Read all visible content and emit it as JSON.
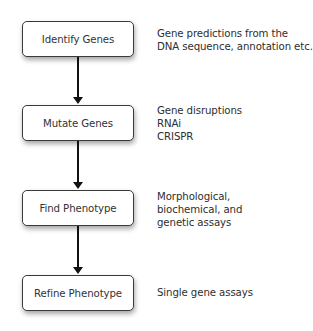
{
  "diagram": {
    "type": "flowchart",
    "direction": "top-to-bottom",
    "steps": [
      {
        "label": "Identify Genes",
        "notes": [
          "Gene predictions from the",
          "DNA sequence, annotation etc."
        ]
      },
      {
        "label": "Mutate Genes",
        "notes": [
          "Gene disruptions",
          "RNAi",
          "CRISPR"
        ]
      },
      {
        "label": "Find Phenotype",
        "notes": [
          "Morphological,",
          "biochemical, and",
          "genetic assays"
        ]
      },
      {
        "label": "Refine Phenotype",
        "notes": [
          "Single gene assays"
        ]
      }
    ],
    "edges": [
      {
        "from": "Identify Genes",
        "to": "Mutate Genes"
      },
      {
        "from": "Mutate Genes",
        "to": "Find Phenotype"
      },
      {
        "from": "Find Phenotype",
        "to": "Refine Phenotype"
      }
    ],
    "colors": {
      "box_border": "#3a3a3a",
      "box_fill": "#ffffff",
      "arrow": "#111111",
      "text": "#333333"
    }
  }
}
